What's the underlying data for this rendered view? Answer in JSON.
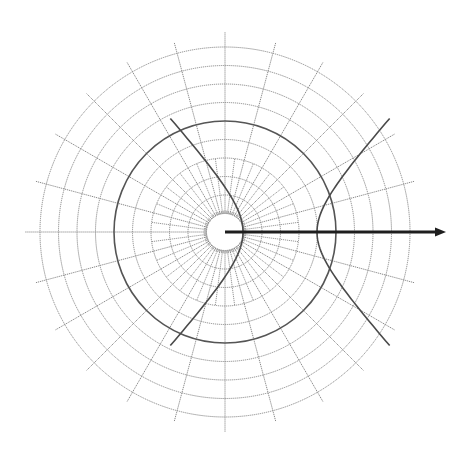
{
  "diagram": {
    "type": "polar-grid-with-conic",
    "pole": {
      "x": 225,
      "y": 232
    },
    "grid": {
      "circle_count": 10,
      "circle_spacing": 18.5,
      "highlighted_circle_index": 6,
      "spoke_step_deg": 15,
      "minor_spoke_step_deg": 7.5,
      "minor_spoke_outer_radius": 74,
      "spoke_outer_radius": 196,
      "inner_tick_step_deg": 5,
      "colors": {
        "grid": "#8a8a8a",
        "highlighted_circle": "#555555"
      }
    },
    "hyperbola": {
      "center": {
        "x": 280,
        "y": 232
      },
      "a": 37,
      "b": 40.7,
      "focus_at_pole": true,
      "color": "#4a4a4a",
      "t_range": 1.75
    },
    "polar_axis": {
      "from": {
        "x": 225,
        "y": 232
      },
      "to": {
        "x": 446,
        "y": 232
      },
      "color": "#1e1e1e"
    }
  }
}
